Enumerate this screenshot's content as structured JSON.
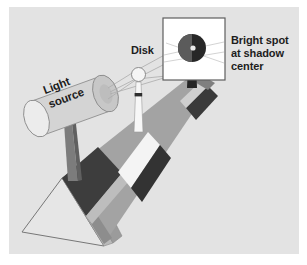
{
  "figure": {
    "background_color": "#e3e3e3",
    "page_color": "#ffffff",
    "width": 307,
    "height": 265
  },
  "labels": {
    "bright_spot": "Bright spot\nat shadow\ncenter",
    "disk": "Disk",
    "light_source": "Light\nsource"
  },
  "colors": {
    "text": "#1d1d1d",
    "bench_top": "#a0a0a0",
    "bench_side": "#9a9a9a",
    "bench_dark_band": "#3f3f3f",
    "bench_light_band": "#f2f2f2",
    "base_face": "#b4b4b4",
    "base_shadow": "#8f8f8f",
    "base_outline": "#6f6f6f",
    "post": "#7b7b7b",
    "post_dark": "#5a5a5a",
    "cylinder_body": "#d2d2d2",
    "cylinder_cap": "#e8e8e8",
    "cylinder_outline": "#8a8a8a",
    "disk_fill": "#f4f4f4",
    "disk_outline": "#8b8b8b",
    "disk_post": "#f6f6f6",
    "screen_fill": "#ffffff",
    "screen_outline": "#5a5a5a",
    "shadow_disk": "#2a2a2a",
    "shadow_disk_mid": "#555555",
    "bright_spot": "#f0f0f0",
    "ray": "#a8a8a8"
  },
  "elements": {
    "light_source": "cylindrical lamp housing on a post",
    "disk": "small circular obstacle on a slender post",
    "screen": "white viewing screen showing the circular shadow",
    "shadow": "dark circular shadow of the disk",
    "bright_spot_mark": "small bright point at the center of the shadow",
    "optical_bench": "inclined rail with mounting saddles",
    "base": "triangular prism base of the bench",
    "rays": "light rays diverging from the source around the disk"
  }
}
